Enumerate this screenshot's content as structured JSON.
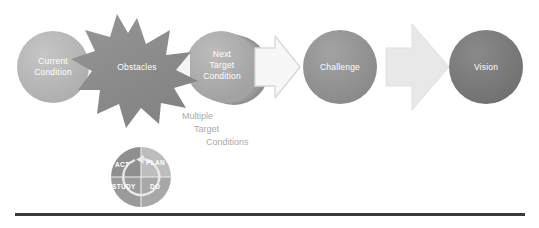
{
  "diagram": {
    "background_color": "#ffffff",
    "baseline_color": "#3a3a3a"
  },
  "nodes": {
    "current_condition": {
      "label": "Current\nCondition",
      "shape": "circle",
      "color": "#b3b3b3",
      "text_color": "#ffffff"
    },
    "obstacles": {
      "label": "Obstacles",
      "shape": "starburst",
      "color": "#8c8c8c",
      "text_color": "#ffffff"
    },
    "next_target_condition": {
      "label": "Next\nTarget\nCondition",
      "shape": "stacked-circles",
      "color": "#a8a8a8",
      "text_color": "#ffffff"
    },
    "challenge": {
      "label": "Challenge",
      "shape": "circle",
      "color": "#919191",
      "text_color": "#ffffff"
    },
    "vision": {
      "label": "Vision",
      "shape": "circle",
      "color": "#787878",
      "text_color": "#ffffff"
    }
  },
  "connectors": {
    "arrow_to_challenge": {
      "name": "outlined-block-arrow",
      "direction": "right",
      "fill": "#f2f2f2",
      "stroke": "#d6d6d6"
    },
    "arrow_to_vision": {
      "name": "filled-block-arrow",
      "direction": "right",
      "fill": "#e6e6e6",
      "stroke": "#dcdcdc"
    },
    "obstacle_notch_left": {
      "name": "notch-arrow-left",
      "fill": "#f5f5f5"
    },
    "obstacle_notch_right": {
      "name": "notch-arrow-right",
      "fill": "#f5f5f5"
    }
  },
  "annotation": {
    "line1": "Multiple",
    "line2": "Target",
    "line3": "Conditions",
    "color": "#a9a9a9"
  },
  "pdsa_wheel": {
    "name": "pdsa-cycle",
    "quadrants": [
      {
        "label": "PLAN",
        "position": "top-right",
        "color": "#bdbdbd"
      },
      {
        "label": "DO",
        "position": "bottom-right",
        "color": "#a8a8a8"
      },
      {
        "label": "STUDY",
        "position": "bottom-left",
        "color": "#9a9a9a"
      },
      {
        "label": "ACT",
        "position": "top-left",
        "color": "#8f8f8f"
      }
    ],
    "arrow_color": "#e8e8e8",
    "text_color": "#ffffff"
  }
}
